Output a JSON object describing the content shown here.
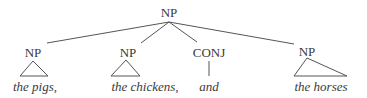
{
  "tree": {
    "root": {
      "label": "NP"
    },
    "children": [
      {
        "label": "NP",
        "text": "the pigs,",
        "shape": "triangle"
      },
      {
        "label": "NP",
        "text": "the chickens,",
        "shape": "triangle"
      },
      {
        "label": "CONJ",
        "text": "and",
        "shape": "line"
      },
      {
        "label": "NP",
        "text": "the horses",
        "shape": "triangle"
      }
    ]
  },
  "colors": {
    "ink": "#3a3a3a",
    "background": "#ffffff"
  }
}
